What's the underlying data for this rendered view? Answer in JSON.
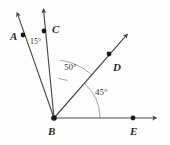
{
  "figure": {
    "type": "geometry-ray-diagram",
    "background_color": "#fefefe",
    "line_color": "#4a4a4a",
    "arc_color": "#8a8a8a",
    "point_color": "#1a1a1a",
    "label_color": "#2b2b2b"
  },
  "points": [
    {
      "id": "A",
      "label": "A",
      "label_x": 10,
      "label_y": 31,
      "dot_x": 23,
      "dot_y": 35
    },
    {
      "id": "C",
      "label": "C",
      "label_x": 52,
      "label_y": 24,
      "dot_x": 44,
      "dot_y": 31
    },
    {
      "id": "D",
      "label": "D",
      "label_x": 113,
      "label_y": 62,
      "dot_x": 109,
      "dot_y": 54
    },
    {
      "id": "B",
      "label": "B",
      "label_x": 48,
      "label_y": 126,
      "dot_x": 54,
      "dot_y": 118
    },
    {
      "id": "E",
      "label": "E",
      "label_x": 130,
      "label_y": 126,
      "dot_x": 133,
      "dot_y": 118
    }
  ],
  "vertex": {
    "id": "B",
    "x": 54,
    "y": 118
  },
  "rays": [
    {
      "id": "BA",
      "from": "B",
      "through": "A",
      "tip_x": 16,
      "tip_y": 12,
      "angle_deg": 70
    },
    {
      "id": "BC",
      "from": "B",
      "through": "C",
      "tip_x": 43,
      "tip_y": 8,
      "angle_deg": 84
    },
    {
      "id": "BD",
      "from": "B",
      "through": "D",
      "tip_x": 129,
      "tip_y": 33,
      "angle_deg": 48.5
    },
    {
      "id": "BE",
      "from": "B",
      "through": "E",
      "tip_x": 158,
      "tip_y": 118,
      "angle_deg": 0
    }
  ],
  "angles": [
    {
      "id": "ABC",
      "value": "15°",
      "between": "BA-BC",
      "label_x": 30,
      "label_y": 38,
      "arc_radius": 40
    },
    {
      "id": "CBD",
      "value": "50°",
      "between": "BC-BD",
      "label_x": 64,
      "label_y": 63,
      "arc_radius": 58
    },
    {
      "id": "DBE",
      "value": "45°",
      "between": "BD-BE",
      "label_x": 95,
      "label_y": 88,
      "arc_radius": 46
    }
  ]
}
